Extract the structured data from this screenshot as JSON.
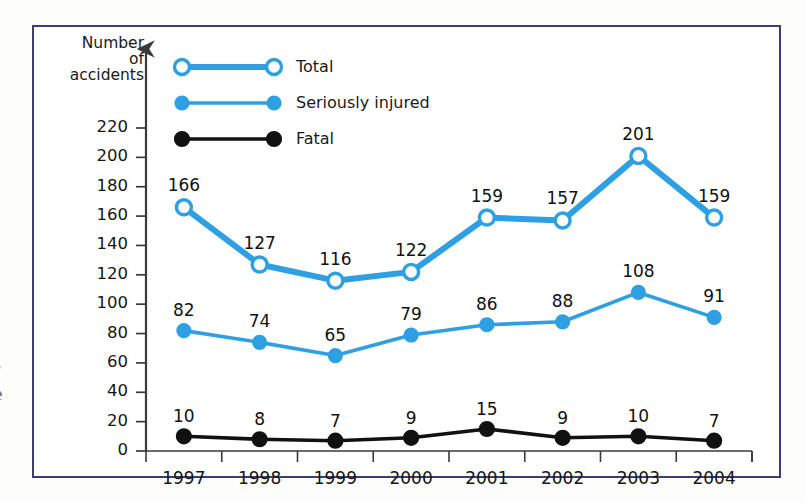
{
  "figure": {
    "y_axis_caption_lines": [
      "Number",
      "of",
      "accidents"
    ],
    "frame_color": "#3c3f6e",
    "background": "#ffffff",
    "edge_fragments": [
      "r",
      "e",
      "-"
    ]
  },
  "legend": {
    "items": [
      {
        "label": "Total",
        "marker": "open-circle",
        "color": "#2f9fe3",
        "width": "thick"
      },
      {
        "label": "Seriously injured",
        "marker": "filled-circle",
        "color": "#2f9fe3",
        "width": "thin"
      },
      {
        "label": "Fatal",
        "marker": "filled-circle",
        "color": "#111111",
        "width": "thin"
      }
    ]
  },
  "chart_data": {
    "type": "line",
    "title": "",
    "xlabel": "",
    "ylabel": "Number of accidents",
    "categories": [
      "1997",
      "1998",
      "1999",
      "2000",
      "2001",
      "2002",
      "2003",
      "2004"
    ],
    "ylim": [
      0,
      230
    ],
    "yticks": [
      0,
      20,
      40,
      60,
      80,
      100,
      120,
      140,
      160,
      180,
      200,
      220
    ],
    "grid": false,
    "legend_position": "top-left-inside",
    "series": [
      {
        "name": "Total",
        "color": "#2f9fe3",
        "marker": "open-circle",
        "values": [
          166,
          127,
          116,
          122,
          159,
          157,
          201,
          159
        ]
      },
      {
        "name": "Seriously injured",
        "color": "#2f9fe3",
        "marker": "filled-circle",
        "values": [
          82,
          74,
          65,
          79,
          86,
          88,
          108,
          91
        ]
      },
      {
        "name": "Fatal",
        "color": "#111111",
        "marker": "filled-circle",
        "values": [
          10,
          8,
          7,
          9,
          15,
          9,
          10,
          7
        ]
      }
    ]
  }
}
